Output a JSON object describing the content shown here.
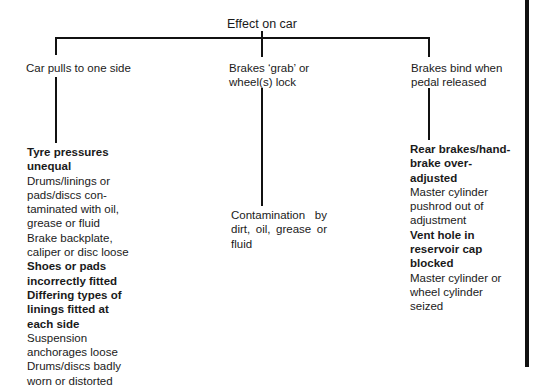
{
  "diagram": {
    "title": "Effect on car",
    "branches": [
      {
        "label_lines": [
          "Car pulls to one side"
        ],
        "causes": [
          {
            "lines": [
              "Tyre pressures",
              "unequal"
            ],
            "bold": true
          },
          {
            "lines": [
              "Drums/linings or",
              "pads/discs con-",
              "taminated with oil,",
              "grease or fluid"
            ],
            "bold": false
          },
          {
            "lines": [
              "Brake backplate,",
              "caliper or disc loose"
            ],
            "bold": false
          },
          {
            "lines": [
              "Shoes or pads",
              "incorrectly fitted"
            ],
            "bold": true
          },
          {
            "lines": [
              "Differing types of",
              "linings fitted at",
              "each side"
            ],
            "bold": true
          },
          {
            "lines": [
              "Suspension",
              "anchorages loose"
            ],
            "bold": false
          },
          {
            "lines": [
              "Drums/discs badly",
              "worn or distorted"
            ],
            "bold": false
          }
        ]
      },
      {
        "label_lines": [
          "Brakes ‘grab’ or",
          "wheel(s) lock"
        ],
        "causes": [
          {
            "text": "Contamination by dirt, oil, grease or fluid",
            "bold": false
          }
        ]
      },
      {
        "label_lines": [
          "Brakes bind when",
          "pedal released"
        ],
        "causes": [
          {
            "lines": [
              "Rear brakes/hand-",
              "brake over-",
              "adjusted"
            ],
            "bold": true
          },
          {
            "lines": [
              "Master cylinder",
              "pushrod out of",
              "adjustment"
            ],
            "bold": false
          },
          {
            "lines": [
              "Vent hole in",
              "reservoir cap",
              "blocked"
            ],
            "bold": true
          },
          {
            "lines": [
              "Master cylinder or",
              "wheel cylinder",
              "seized"
            ],
            "bold": false
          }
        ]
      }
    ]
  },
  "colors": {
    "line": "#111111",
    "text": "#1a1a1a",
    "background": "#ffffff"
  }
}
